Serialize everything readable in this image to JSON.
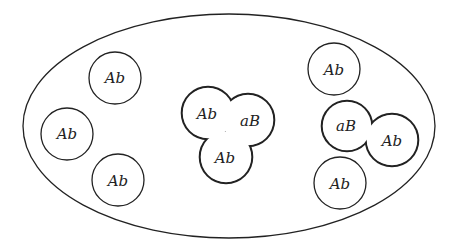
{
  "diagram": {
    "container": "population-ellipse",
    "singles": [
      {
        "id": "cell-left-top",
        "label": "Ab"
      },
      {
        "id": "cell-left-middle",
        "label": "Ab"
      },
      {
        "id": "cell-left-bottom",
        "label": "Ab"
      },
      {
        "id": "cell-right-top",
        "label": "Ab"
      },
      {
        "id": "cell-right-bottom",
        "label": "Ab"
      }
    ],
    "clusters": [
      {
        "id": "cluster-center",
        "cells": [
          {
            "label": "Ab"
          },
          {
            "label": "aB"
          },
          {
            "label": "Ab"
          }
        ]
      },
      {
        "id": "cluster-right",
        "cells": [
          {
            "label": "aB"
          },
          {
            "label": "Ab"
          }
        ]
      }
    ],
    "stroke_color": "#222222"
  }
}
